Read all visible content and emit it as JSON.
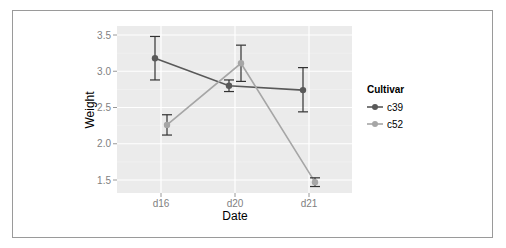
{
  "chart_data": {
    "type": "line",
    "title": "",
    "xlabel": "Date",
    "ylabel": "Weight",
    "categories": [
      "d16",
      "d20",
      "d21"
    ],
    "ylim": [
      1.3,
      3.63
    ],
    "yticks": [
      1.5,
      2.0,
      2.5,
      3.0,
      3.5
    ],
    "ytick_labels": [
      "1.5",
      "2.0",
      "2.5",
      "3.0",
      "3.5"
    ],
    "grid": true,
    "legend_position": "right",
    "legend": {
      "title": "Cultivar",
      "entries": [
        "c39",
        "c52"
      ]
    },
    "series": [
      {
        "name": "c39",
        "color": "#595959",
        "values": [
          3.18,
          2.8,
          2.74
        ],
        "error_upper": [
          3.48,
          2.88,
          3.05
        ],
        "error_lower": [
          2.88,
          2.72,
          2.44
        ],
        "dodge": -0.08
      },
      {
        "name": "c52",
        "color": "#a6a6a6",
        "values": [
          2.26,
          3.11,
          1.47
        ],
        "error_upper": [
          2.4,
          3.36,
          1.53
        ],
        "error_lower": [
          2.12,
          2.86,
          1.41
        ],
        "dodge": 0.08
      }
    ],
    "colors": {
      "panel_background": "#ebebeb",
      "grid_major": "#ffffff",
      "grid_minor": "#f5f5f5",
      "tick_label": "#7f7f7f"
    }
  }
}
